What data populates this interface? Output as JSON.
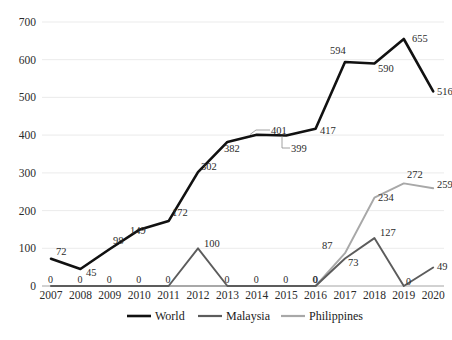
{
  "chart_data": {
    "type": "line",
    "title": "",
    "xlabel": "",
    "ylabel": "",
    "ylim": [
      0,
      700
    ],
    "ytick_step": 100,
    "grid": true,
    "legend_position": "bottom",
    "categories": [
      "2007",
      "2008",
      "2009",
      "2010",
      "2011",
      "2012",
      "2013",
      "2014",
      "2015",
      "2016",
      "2017",
      "2018",
      "2019",
      "2020"
    ],
    "ytick_labels": [
      "0",
      "100",
      "200",
      "300",
      "400",
      "500",
      "600",
      "700"
    ],
    "series": [
      {
        "name": "World",
        "color": "#111111",
        "values": [
          72,
          45,
          98,
          149,
          172,
          302,
          382,
          401,
          399,
          417,
          594,
          590,
          655,
          516
        ],
        "point_labels": [
          "72",
          "45",
          "98",
          "149",
          "172",
          "302",
          "382",
          "401",
          "399",
          "417",
          "594",
          "590",
          "655",
          "516"
        ]
      },
      {
        "name": "Malaysia",
        "color": "#5c5c5c",
        "values": [
          0,
          0,
          0,
          0,
          0,
          100,
          0,
          0,
          0,
          0,
          73,
          127,
          0,
          49
        ],
        "point_labels": [
          "0",
          "0",
          "0",
          "0",
          "0",
          "100",
          "0",
          "0",
          "0",
          "0",
          "73",
          "127",
          "0",
          "49"
        ]
      },
      {
        "name": "Philippines",
        "color": "#a8a8a8",
        "values": [
          0,
          0,
          0,
          0,
          0,
          0,
          0,
          0,
          0,
          0,
          87,
          234,
          272,
          259
        ],
        "point_labels": [
          "0",
          "0",
          "0",
          "0",
          "0",
          "0",
          "0",
          "0",
          "0",
          "0",
          "87",
          "234",
          "272",
          "259"
        ]
      }
    ]
  },
  "legend": {
    "items": [
      {
        "label": "World",
        "color": "#111111"
      },
      {
        "label": "Malaysia",
        "color": "#5c5c5c"
      },
      {
        "label": "Philippines",
        "color": "#a8a8a8"
      }
    ]
  },
  "axis": {
    "y_labels": [
      "700",
      "600",
      "500",
      "400",
      "300",
      "200",
      "100",
      "0"
    ],
    "x_labels": [
      "2007",
      "2008",
      "2009",
      "2010",
      "2011",
      "2012",
      "2013",
      "2014",
      "2015",
      "2016",
      "2017",
      "2018",
      "2019",
      "2020"
    ]
  },
  "labels": {
    "world": {
      "y2007": "72",
      "y2008": "45",
      "y2009": "98",
      "y2010": "149",
      "y2011": "172",
      "y2012": "302",
      "y2013": "382",
      "y2014": "401",
      "y2015": "399",
      "y2016": "417",
      "y2017": "594",
      "y2018": "590",
      "y2019": "655",
      "y2020": "516"
    },
    "malaysia": {
      "y2007": "0",
      "y2008": "0",
      "y2009": "0",
      "y2010": "0",
      "y2011": "0",
      "y2012": "100",
      "y2013": "0",
      "y2014": "0",
      "y2015": "0",
      "y2016": "0",
      "y2017": "73",
      "y2018": "127",
      "y2019": "0",
      "y2020": "49"
    },
    "philippines": {
      "y2017": "87",
      "y2018": "234",
      "y2019": "272",
      "y2020": "259"
    }
  }
}
